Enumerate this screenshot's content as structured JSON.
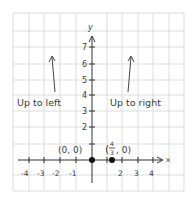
{
  "diagram": {
    "type": "coordinate-plane-sketch",
    "axes": {
      "x_label": "x",
      "y_label": "y",
      "x_ticks": [
        "-4",
        "-3",
        "-2",
        "-1",
        "2",
        "3",
        "4"
      ],
      "y_ticks": [
        "2",
        "3",
        "4",
        "5",
        "6",
        "7"
      ]
    },
    "points": [
      {
        "label": "(0, 0)",
        "x": 0,
        "y": 0
      },
      {
        "label_num": "4",
        "label_den": "3",
        "label_prefix": "(",
        "label_suffix": ", 0)",
        "x": 1.3333,
        "y": 0
      }
    ],
    "annotations": {
      "left": "Up to left",
      "right": "Up to right"
    },
    "colors": {
      "grid": "#d8d8d8",
      "ink": "#333333",
      "background": "#ffffff"
    }
  }
}
